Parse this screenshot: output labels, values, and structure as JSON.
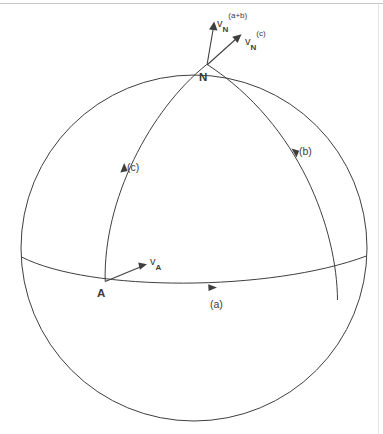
{
  "figure": {
    "type": "geometry-diagram",
    "background_color": "#ffffff",
    "stroke_color": "#3f3f3f",
    "top_rule_color": "#c8c8c8"
  },
  "points": {
    "north": {
      "label": "N",
      "x": 207,
      "y": 65
    },
    "a_point": {
      "label": "A",
      "x": 105,
      "y": 281
    }
  },
  "arcs": [
    {
      "id": "a",
      "label": "(a)",
      "description": "equator arc from A eastward",
      "arrow": "east"
    },
    {
      "id": "b",
      "label": "(b)",
      "description": "meridian arc rising to N from the east",
      "arrow": "north"
    },
    {
      "id": "c",
      "label": "(c)",
      "description": "great-circle arc from A rising to N",
      "arrow": "north"
    }
  ],
  "vectors": [
    {
      "id": "vN_ab",
      "base": "v",
      "sub": "N",
      "sup": "(a+b)",
      "origin": {
        "x": 207,
        "y": 65
      },
      "tip": {
        "x": 213,
        "y": 24
      }
    },
    {
      "id": "vN_c",
      "base": "v",
      "sub": "N",
      "sup": "(c)",
      "origin": {
        "x": 207,
        "y": 65
      },
      "tip": {
        "x": 240,
        "y": 35
      }
    },
    {
      "id": "vA",
      "base": "v",
      "sub": "A",
      "sup": "",
      "origin": {
        "x": 105,
        "y": 281
      },
      "tip": {
        "x": 146,
        "y": 264
      }
    }
  ],
  "sphere": {
    "center_x": 194,
    "center_y": 248,
    "radius": 173,
    "equator_label": "(a)"
  }
}
